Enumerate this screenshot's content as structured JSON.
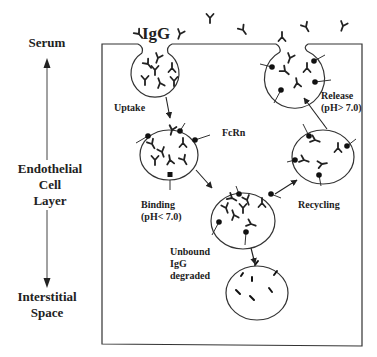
{
  "diagram": {
    "title_label": "IgG",
    "axis": {
      "top_label": "Serum",
      "middle_label_line1": "Endothelial",
      "middle_label_line2": "Cell",
      "middle_label_line3": "Layer",
      "bottom_label_line1": "Interstitial",
      "bottom_label_line2": "Space"
    },
    "steps": {
      "uptake": "Uptake",
      "fcrn": "FcRn",
      "binding_line1": "Binding",
      "binding_line2": "(pH< 7.0)",
      "recycling": "Recycling",
      "release_line1": "Release",
      "release_line2": "(pH> 7.0)",
      "degraded_line1": "Unbound",
      "degraded_line2": "IgG",
      "degraded_line3": "degraded"
    },
    "colors": {
      "line": "#333333",
      "text": "#222222",
      "background": "#ffffff"
    }
  }
}
